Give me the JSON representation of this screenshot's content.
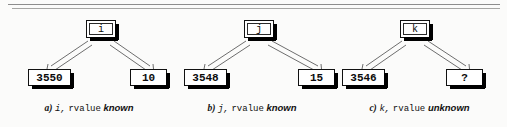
{
  "figure": {
    "divider": "horizontal-double-rule",
    "colors": {
      "box_fill": "#ffffff",
      "box_border": "#111111",
      "box_shadow": "#000000",
      "arrow": "#6e6e6e",
      "background": "#fbfbfa",
      "text": "#0b0b0b"
    }
  },
  "panels": [
    {
      "id": "a",
      "name_box": "i",
      "left_value": "3550",
      "right_value": "10",
      "caption": {
        "label": "a)",
        "variable": "i,",
        "keyword": "rvalue",
        "state": "known"
      }
    },
    {
      "id": "b",
      "name_box": "j",
      "left_value": "3548",
      "right_value": "15",
      "caption": {
        "label": "b)",
        "variable": "j,",
        "keyword": "rvalue",
        "state": "known"
      }
    },
    {
      "id": "c",
      "name_box": "k",
      "left_value": "3546",
      "right_value": "?",
      "caption": {
        "label": "c)",
        "variable": "k,",
        "keyword": "rvalue",
        "state": "unknown"
      }
    }
  ]
}
